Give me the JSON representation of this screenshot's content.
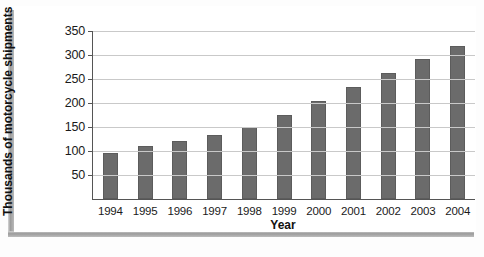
{
  "chart_data": {
    "type": "bar",
    "title": "",
    "xlabel": "Year",
    "ylabel": "Thousands of motorcycle shipments",
    "categories": [
      "1994",
      "1995",
      "1996",
      "1997",
      "1998",
      "1999",
      "2000",
      "2001",
      "2002",
      "2003",
      "2004"
    ],
    "values": [
      96,
      111,
      120,
      133,
      151,
      176,
      205,
      234,
      263,
      291,
      318
    ],
    "series": [
      {
        "name": "Motorcycle shipments",
        "values": [
          96,
          111,
          120,
          133,
          151,
          176,
          205,
          234,
          263,
          291,
          318
        ]
      }
    ],
    "ylim": [
      0,
      350
    ],
    "yticks": [
      50,
      100,
      150,
      200,
      250,
      300,
      350
    ],
    "ytick_labels": [
      "50",
      "100",
      "150",
      "200",
      "250",
      "300",
      "350"
    ],
    "grid": true,
    "legend": false,
    "legend_position": "none",
    "bar_color": "#6b6b6b",
    "gridline_color": "#c9c9c9",
    "axis_color": "#555555",
    "background_color": "#ffffff"
  }
}
